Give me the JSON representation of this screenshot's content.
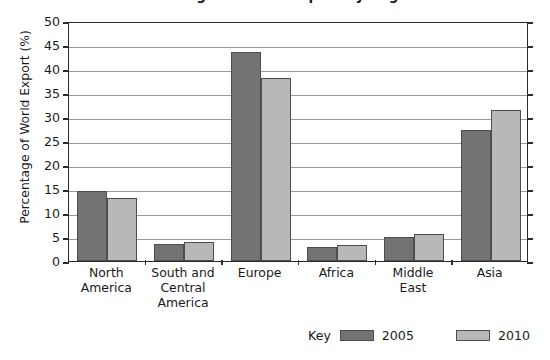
{
  "chart_data": {
    "type": "bar",
    "title": "Percentage of World Export by Region",
    "xlabel": "",
    "ylabel": "Percentage of World Export (%)",
    "ylim": [
      0,
      50
    ],
    "ytick_step": 5,
    "yticks": [
      0,
      5,
      10,
      15,
      20,
      25,
      30,
      35,
      40,
      45,
      50
    ],
    "grid": true,
    "legend_position": "bottom-right",
    "legend_key_label": "Key",
    "categories": [
      "North\nAmerica",
      "South and\nCentral\nAmerica",
      "Europe",
      "Africa",
      "Middle\nEast",
      "Asia"
    ],
    "category_lines": [
      [
        "North",
        "America"
      ],
      [
        "South and",
        "Central",
        "America"
      ],
      [
        "Europe"
      ],
      [
        "Africa"
      ],
      [
        "Middle",
        "East"
      ],
      [
        "Asia"
      ]
    ],
    "series": [
      {
        "name": "2005",
        "color": "#737373",
        "values": [
          14.5,
          3.6,
          43.5,
          3.0,
          5.0,
          27.3
        ]
      },
      {
        "name": "2010",
        "color": "#b8b8b8",
        "values": [
          13.2,
          3.9,
          38.2,
          3.3,
          5.7,
          31.5
        ]
      }
    ]
  },
  "axis": {
    "y_title": "Percentage of World Export (%)",
    "y_tick_labels": [
      "50",
      "45",
      "40",
      "35",
      "30",
      "25",
      "20",
      "15",
      "10",
      "5",
      "0"
    ]
  },
  "legend": {
    "key_label": "Key",
    "entries": [
      {
        "label": "2005",
        "color": "#737373"
      },
      {
        "label": "2010",
        "color": "#b8b8b8"
      }
    ]
  },
  "title": {
    "text": "Percentage of World Export by Region"
  }
}
